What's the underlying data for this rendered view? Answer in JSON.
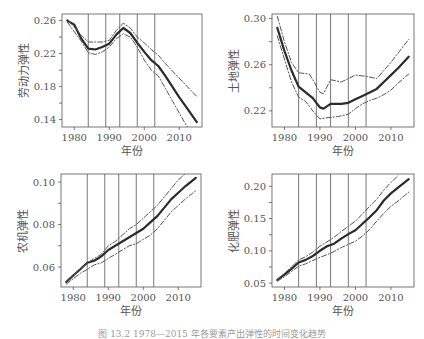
{
  "figure": {
    "caption": "图 13.2  1978—2015 年各要素产出弹性的时间变化趋势"
  },
  "chart_data": [
    {
      "type": "line",
      "title": "",
      "xlabel": "年份",
      "ylabel": "劳动力弹性",
      "xlim": [
        1976.5,
        2016.5
      ],
      "ylim": [
        0.131,
        0.268
      ],
      "xticks": [
        1980,
        1990,
        2000,
        2010
      ],
      "xtick_labels": [
        "1980",
        "1990",
        "2000",
        "2010"
      ],
      "yticks": [
        0.14,
        0.16,
        0.18,
        0.2,
        0.22,
        0.24,
        0.26
      ],
      "ytick_labels": [
        "0.14",
        "",
        "0.18",
        "",
        "0.22",
        "",
        "0.26"
      ],
      "vlines": [
        1984,
        1989,
        1993,
        1998,
        2003
      ],
      "grid": false,
      "series": [
        {
          "name": "估计值",
          "style": "solid",
          "x": [
            1978,
            1980,
            1982,
            1984,
            1986,
            1988,
            1990,
            1992,
            1994,
            1996,
            1998,
            2000,
            2002,
            2004,
            2006,
            2008,
            2010,
            2012,
            2014,
            2015
          ],
          "values": [
            0.26,
            0.255,
            0.238,
            0.226,
            0.225,
            0.228,
            0.232,
            0.243,
            0.251,
            0.245,
            0.233,
            0.222,
            0.212,
            0.205,
            0.193,
            0.18,
            0.167,
            0.155,
            0.143,
            0.137
          ]
        },
        {
          "name": "置信上限",
          "style": "dashdot",
          "x": [
            1978,
            1982,
            1984,
            1988,
            1990,
            1992,
            1994,
            1996,
            1998,
            2000,
            2002,
            2004,
            2006,
            2010,
            2015
          ],
          "values": [
            0.262,
            0.242,
            0.234,
            0.234,
            0.236,
            0.248,
            0.257,
            0.251,
            0.24,
            0.233,
            0.225,
            0.218,
            0.208,
            0.19,
            0.168
          ]
        },
        {
          "name": "置信下限",
          "style": "dashdot",
          "x": [
            1978,
            1982,
            1984,
            1986,
            1988,
            1990,
            1992,
            1994,
            1996,
            1998,
            2000,
            2002,
            2004,
            2006,
            2008,
            2010,
            2012,
            2013
          ],
          "values": [
            0.258,
            0.235,
            0.221,
            0.219,
            0.222,
            0.228,
            0.238,
            0.244,
            0.24,
            0.228,
            0.212,
            0.2,
            0.193,
            0.178,
            0.163,
            0.148,
            0.133,
            0.128
          ]
        }
      ]
    },
    {
      "type": "line",
      "title": "",
      "xlabel": "年份",
      "ylabel": "土地弹性",
      "xlim": [
        1976.5,
        2016.5
      ],
      "ylim": [
        0.206,
        0.304
      ],
      "xticks": [
        1980,
        1990,
        2000,
        2010
      ],
      "xtick_labels": [
        "1980",
        "1990",
        "2000",
        "2010"
      ],
      "yticks": [
        0.22,
        0.24,
        0.26,
        0.28,
        0.3
      ],
      "ytick_labels": [
        "0.22",
        "",
        "0.26",
        "",
        "0.30"
      ],
      "vlines": [
        1984,
        1989,
        1993,
        1998,
        2003
      ],
      "grid": false,
      "series": [
        {
          "name": "估计值",
          "style": "solid",
          "x": [
            1978,
            1980,
            1982,
            1984,
            1986,
            1988,
            1990,
            1991,
            1993,
            1996,
            1998,
            2000,
            2002,
            2004,
            2006,
            2008,
            2010,
            2012,
            2015
          ],
          "values": [
            0.292,
            0.272,
            0.255,
            0.241,
            0.236,
            0.231,
            0.223,
            0.222,
            0.226,
            0.226,
            0.227,
            0.23,
            0.233,
            0.236,
            0.239,
            0.245,
            0.251,
            0.257,
            0.267
          ]
        },
        {
          "name": "置信上限",
          "style": "dashdot",
          "x": [
            1978,
            1980,
            1982,
            1984,
            1987,
            1988,
            1990,
            1991,
            1993,
            1996,
            1998,
            2000,
            2003,
            2006,
            2008,
            2010,
            2012,
            2015
          ],
          "values": [
            0.302,
            0.28,
            0.262,
            0.253,
            0.252,
            0.247,
            0.236,
            0.235,
            0.247,
            0.245,
            0.248,
            0.251,
            0.25,
            0.248,
            0.255,
            0.262,
            0.27,
            0.282
          ]
        },
        {
          "name": "置信下限",
          "style": "dashdot",
          "x": [
            1978,
            1980,
            1982,
            1984,
            1986,
            1988,
            1990,
            1992,
            1995,
            1998,
            2000,
            2002,
            2004,
            2006,
            2008,
            2010,
            2012,
            2015
          ],
          "values": [
            0.285,
            0.265,
            0.245,
            0.232,
            0.228,
            0.22,
            0.213,
            0.214,
            0.215,
            0.217,
            0.222,
            0.226,
            0.229,
            0.231,
            0.234,
            0.238,
            0.244,
            0.252
          ]
        }
      ]
    },
    {
      "type": "line",
      "title": "",
      "xlabel": "年份",
      "ylabel": "农机弹性",
      "xlim": [
        1976.5,
        2016.5
      ],
      "ylim": [
        0.0506,
        0.1038
      ],
      "xticks": [
        1980,
        1990,
        2000,
        2010
      ],
      "xtick_labels": [
        "1980",
        "1990",
        "2000",
        "2010"
      ],
      "yticks": [
        0.06,
        0.07,
        0.08,
        0.09,
        0.1
      ],
      "ytick_labels": [
        "0.06",
        "",
        "0.08",
        "",
        "0.10"
      ],
      "vlines": [
        1984,
        1989,
        1993,
        1998,
        2003
      ],
      "grid": false,
      "series": [
        {
          "name": "估计值",
          "style": "solid",
          "x": [
            1978,
            1980,
            1982,
            1984,
            1986,
            1988,
            1990,
            1992,
            1994,
            1996,
            1998,
            2000,
            2002,
            2004,
            2006,
            2008,
            2010,
            2012,
            2015
          ],
          "values": [
            0.053,
            0.056,
            0.059,
            0.062,
            0.063,
            0.065,
            0.068,
            0.07,
            0.072,
            0.074,
            0.076,
            0.078,
            0.081,
            0.084,
            0.088,
            0.092,
            0.095,
            0.098,
            0.102
          ]
        },
        {
          "name": "置信上限",
          "style": "dashdot",
          "x": [
            1978,
            1982,
            1984,
            1986,
            1988,
            1990,
            1992,
            1994,
            1996,
            1998,
            2000,
            2002,
            2004,
            2006,
            2008,
            2010,
            2012
          ],
          "values": [
            0.053,
            0.059,
            0.062,
            0.064,
            0.066,
            0.07,
            0.072,
            0.075,
            0.078,
            0.08,
            0.083,
            0.086,
            0.089,
            0.093,
            0.097,
            0.101,
            0.104
          ]
        },
        {
          "name": "置信下限",
          "style": "dashdot",
          "x": [
            1978,
            1982,
            1984,
            1986,
            1988,
            1990,
            1992,
            1994,
            1996,
            1998,
            2000,
            2002,
            2004,
            2006,
            2008,
            2010,
            2012,
            2015
          ],
          "values": [
            0.052,
            0.057,
            0.059,
            0.061,
            0.062,
            0.064,
            0.066,
            0.068,
            0.07,
            0.071,
            0.073,
            0.075,
            0.078,
            0.082,
            0.086,
            0.089,
            0.092,
            0.096
          ]
        }
      ]
    },
    {
      "type": "line",
      "title": "",
      "xlabel": "年份",
      "ylabel": "化肥弹性",
      "xlim": [
        1976.5,
        2016.5
      ],
      "ylim": [
        0.044,
        0.219
      ],
      "xticks": [
        1980,
        1990,
        2000,
        2010
      ],
      "xtick_labels": [
        "1980",
        "1990",
        "2000",
        "2010"
      ],
      "yticks": [
        0.05,
        0.075,
        0.1,
        0.125,
        0.15,
        0.175,
        0.2
      ],
      "ytick_labels": [
        "0.05",
        "",
        "0.10",
        "",
        "0.15",
        "",
        "0.20"
      ],
      "vlines": [
        1984,
        1989,
        1993,
        1998,
        2003
      ],
      "grid": false,
      "series": [
        {
          "name": "估计值",
          "style": "solid",
          "x": [
            1978,
            1980,
            1982,
            1984,
            1986,
            1988,
            1990,
            1992,
            1994,
            1996,
            1998,
            2000,
            2002,
            2004,
            2006,
            2008,
            2010,
            2012,
            2015
          ],
          "values": [
            0.055,
            0.063,
            0.072,
            0.082,
            0.086,
            0.092,
            0.1,
            0.107,
            0.111,
            0.119,
            0.126,
            0.132,
            0.142,
            0.152,
            0.163,
            0.178,
            0.189,
            0.198,
            0.211
          ]
        },
        {
          "name": "置信上限",
          "style": "dashdot",
          "x": [
            1978,
            1980,
            1982,
            1984,
            1986,
            1988,
            1990,
            1992,
            1994,
            1996,
            1998,
            2000,
            2002,
            2004,
            2006,
            2008,
            2010,
            2012
          ],
          "values": [
            0.056,
            0.065,
            0.075,
            0.086,
            0.091,
            0.098,
            0.107,
            0.114,
            0.121,
            0.13,
            0.138,
            0.146,
            0.157,
            0.169,
            0.18,
            0.194,
            0.206,
            0.216
          ]
        },
        {
          "name": "置信下限",
          "style": "dashdot",
          "x": [
            1978,
            1980,
            1982,
            1984,
            1986,
            1988,
            1990,
            1992,
            1994,
            1996,
            1998,
            2000,
            2002,
            2004,
            2006,
            2008,
            2010,
            2012,
            2015
          ],
          "values": [
            0.053,
            0.06,
            0.068,
            0.076,
            0.08,
            0.085,
            0.09,
            0.094,
            0.099,
            0.105,
            0.11,
            0.115,
            0.123,
            0.133,
            0.146,
            0.158,
            0.169,
            0.177,
            0.191
          ]
        }
      ]
    }
  ],
  "layout": {
    "panels": [
      {
        "box": [
          62,
          14,
          202,
          127
        ]
      },
      {
        "box": [
          272,
          14,
          414,
          127
        ]
      },
      {
        "box": [
          61,
          174,
          201,
          287
        ]
      },
      {
        "box": [
          272,
          174,
          414,
          287
        ]
      }
    ],
    "colors": {
      "line": "#2b2b2b",
      "ci": "#555555",
      "vline": "#555555",
      "axis": "#555555",
      "text": "#555555"
    }
  }
}
